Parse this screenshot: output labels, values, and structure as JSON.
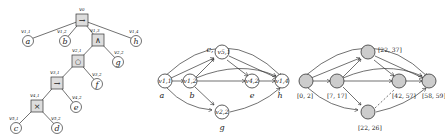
{
  "tree": {
    "root": {
      "label": "v0",
      "op": "→"
    },
    "nodes": [
      {
        "id": "v11",
        "label": "v1,1",
        "leaf": "a"
      },
      {
        "id": "v12",
        "label": "v1,2",
        "leaf": "b"
      },
      {
        "id": "v13",
        "label": "v1,3",
        "op": "∧"
      },
      {
        "id": "v14",
        "label": "v1,4",
        "leaf": "h"
      },
      {
        "id": "v21",
        "label": "v2,1",
        "op": "○"
      },
      {
        "id": "v22",
        "label": "v2,2",
        "leaf": "g"
      },
      {
        "id": "v31",
        "label": "v3,1",
        "op": "→"
      },
      {
        "id": "v32",
        "label": "v3,2",
        "leaf": "f"
      },
      {
        "id": "v41",
        "label": "v4,1",
        "op": "×"
      },
      {
        "id": "v42",
        "label": "v4,2",
        "leaf": "e"
      },
      {
        "id": "v51",
        "label": "v5,1",
        "leaf": "c"
      },
      {
        "id": "v52",
        "label": "v5,2",
        "leaf": "d"
      }
    ]
  },
  "graph": {
    "nodes": [
      {
        "label": "v1,1",
        "name": "a"
      },
      {
        "label": "v1,2",
        "name": "b"
      },
      {
        "label": "v5,1",
        "name": "c,"
      },
      {
        "label": "v4,2",
        "name": "e"
      },
      {
        "label": "v1,4",
        "name": "h"
      },
      {
        "label": "v2,2",
        "name": "g"
      }
    ]
  },
  "timed": {
    "intervals": [
      "[0, 2]",
      "[7, 17]",
      "[22, 37]",
      "[42, 57]",
      "[58, 59]",
      "[22, 26]"
    ]
  }
}
